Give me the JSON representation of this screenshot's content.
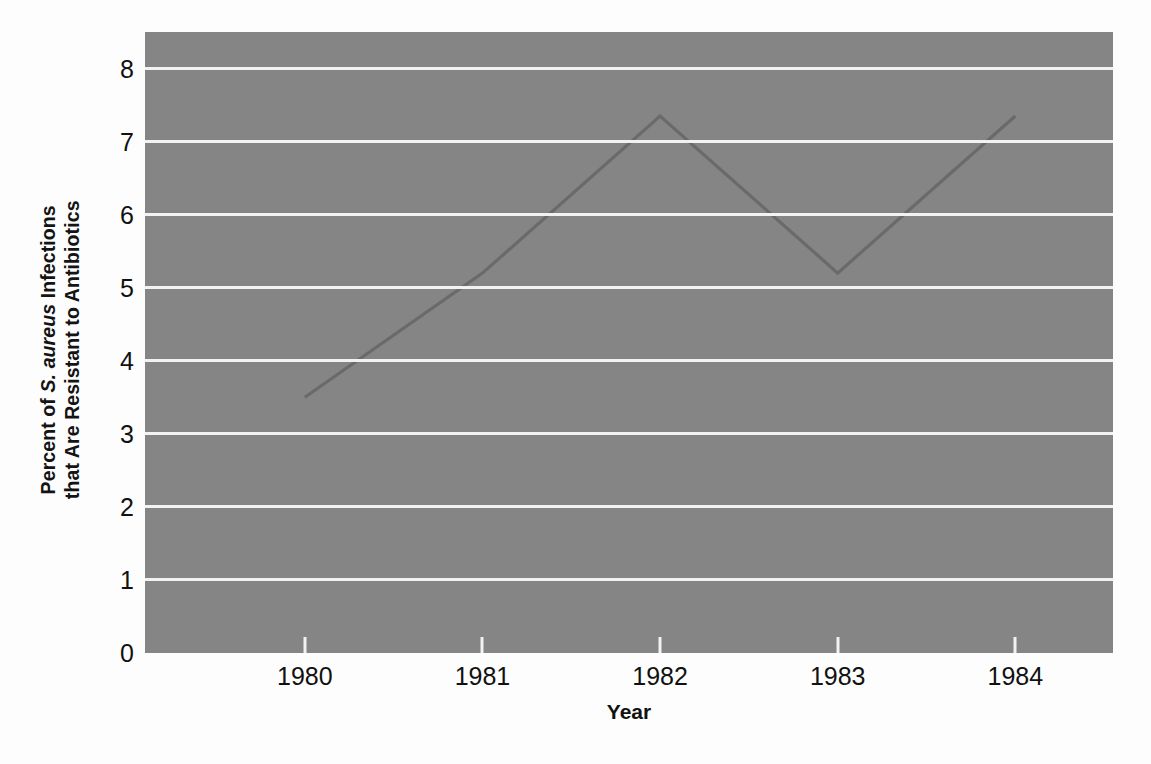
{
  "figure": {
    "background_color": "#fdfdfd",
    "plot_background_color": "#858585",
    "gridline_color": "#f2f2f2",
    "line_color": "#6a6a6a",
    "text_color": "#111111"
  },
  "axes": {
    "y_title_line1_prefix": "Percent of ",
    "y_title_italic": "S. aureus",
    "y_title_line1_suffix": " Infections",
    "y_title_line2": "that Are Resistant to Antibiotics",
    "x_title": "Year"
  },
  "chart_data": {
    "type": "line",
    "title": "",
    "xlabel": "Year",
    "ylabel": "Percent of S. aureus Infections that Are Resistant to Antibiotics",
    "x": [
      1980,
      1981,
      1982,
      1983,
      1984
    ],
    "xticklabels": [
      "1980",
      "1981",
      "1982",
      "1983",
      "1984"
    ],
    "values": [
      3.5,
      5.2,
      7.35,
      5.2,
      7.35
    ],
    "yticks": [
      0,
      1,
      2,
      3,
      4,
      5,
      6,
      7,
      8
    ],
    "yticklabels": [
      "0",
      "1",
      "2",
      "3",
      "4",
      "5",
      "6",
      "7",
      "8"
    ],
    "ylim": [
      0,
      8.5
    ],
    "xlim": [
      1979.1,
      1984.55
    ],
    "grid": "horizontal",
    "legend": "none",
    "series": [
      {
        "name": "Percent resistant",
        "values": [
          3.5,
          5.2,
          7.35,
          5.2,
          7.35
        ]
      }
    ]
  }
}
